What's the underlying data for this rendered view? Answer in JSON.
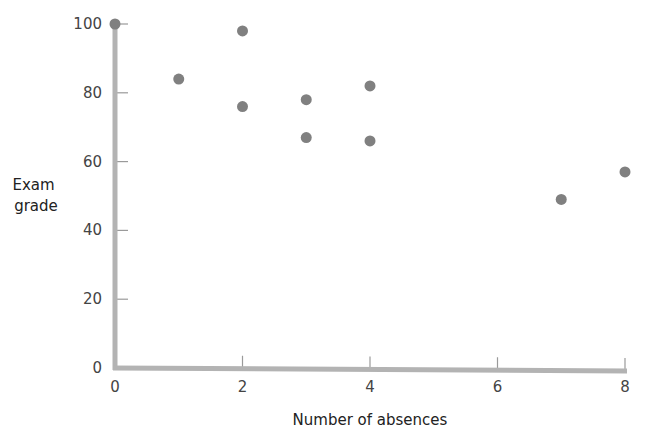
{
  "chart_data": {
    "type": "scatter",
    "title": "",
    "xlabel": "Number of absences",
    "ylabel": "Exam grade",
    "ylabel_lines": [
      "Exam",
      "grade"
    ],
    "xlim": [
      0,
      8
    ],
    "ylim": [
      0,
      100
    ],
    "x_ticks": [
      0,
      2,
      4,
      6,
      8
    ],
    "y_ticks": [
      0,
      20,
      40,
      60,
      80,
      100
    ],
    "grid": false,
    "legend": null,
    "points": [
      {
        "x": 0,
        "y": 100
      },
      {
        "x": 1,
        "y": 84
      },
      {
        "x": 2,
        "y": 98
      },
      {
        "x": 2,
        "y": 76
      },
      {
        "x": 3,
        "y": 78
      },
      {
        "x": 3,
        "y": 67
      },
      {
        "x": 4,
        "y": 82
      },
      {
        "x": 4,
        "y": 66
      },
      {
        "x": 7,
        "y": 49
      },
      {
        "x": 8,
        "y": 57
      }
    ],
    "colors": {
      "axis": "#b3b3b3",
      "tick": "#9a9a9a",
      "point": "#808080"
    }
  }
}
